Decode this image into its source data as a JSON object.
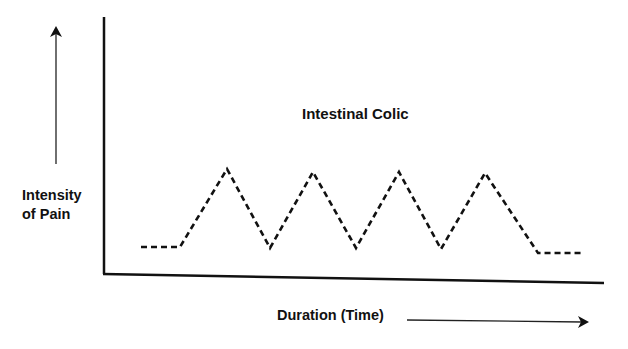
{
  "chart_data": {
    "type": "line",
    "title": "Intestinal Colic",
    "xlabel": "Duration (Time)",
    "ylabel_line1": "Intensity",
    "ylabel_line2": "of Pain",
    "ylabel": "Intensity of Pain",
    "grid": false,
    "legend": null,
    "line_style": "dashed",
    "line_color": "#111111",
    "axis_color": "#111111",
    "x": [
      0,
      1,
      2,
      3,
      4,
      5,
      6,
      7,
      8,
      9,
      10,
      11
    ],
    "values": [
      1,
      1,
      9,
      1,
      9,
      1,
      9,
      1,
      9,
      1,
      1,
      1
    ],
    "points_px": [
      [
        141,
        247
      ],
      [
        180,
        247
      ],
      [
        227,
        169
      ],
      [
        270,
        248
      ],
      [
        313,
        172
      ],
      [
        356,
        248
      ],
      [
        399,
        172
      ],
      [
        441,
        249
      ],
      [
        485,
        173
      ],
      [
        538,
        253
      ],
      [
        581,
        253
      ]
    ],
    "axes_px": {
      "origin": [
        104,
        274
      ],
      "y_top": [
        104,
        17
      ],
      "x_end": [
        604,
        283
      ]
    },
    "arrows_px": {
      "y_arrow": {
        "from": [
          56,
          164
        ],
        "to": [
          56,
          27
        ]
      },
      "x_arrow": {
        "from": [
          407,
          320
        ],
        "to": [
          588,
          322
        ]
      }
    }
  }
}
